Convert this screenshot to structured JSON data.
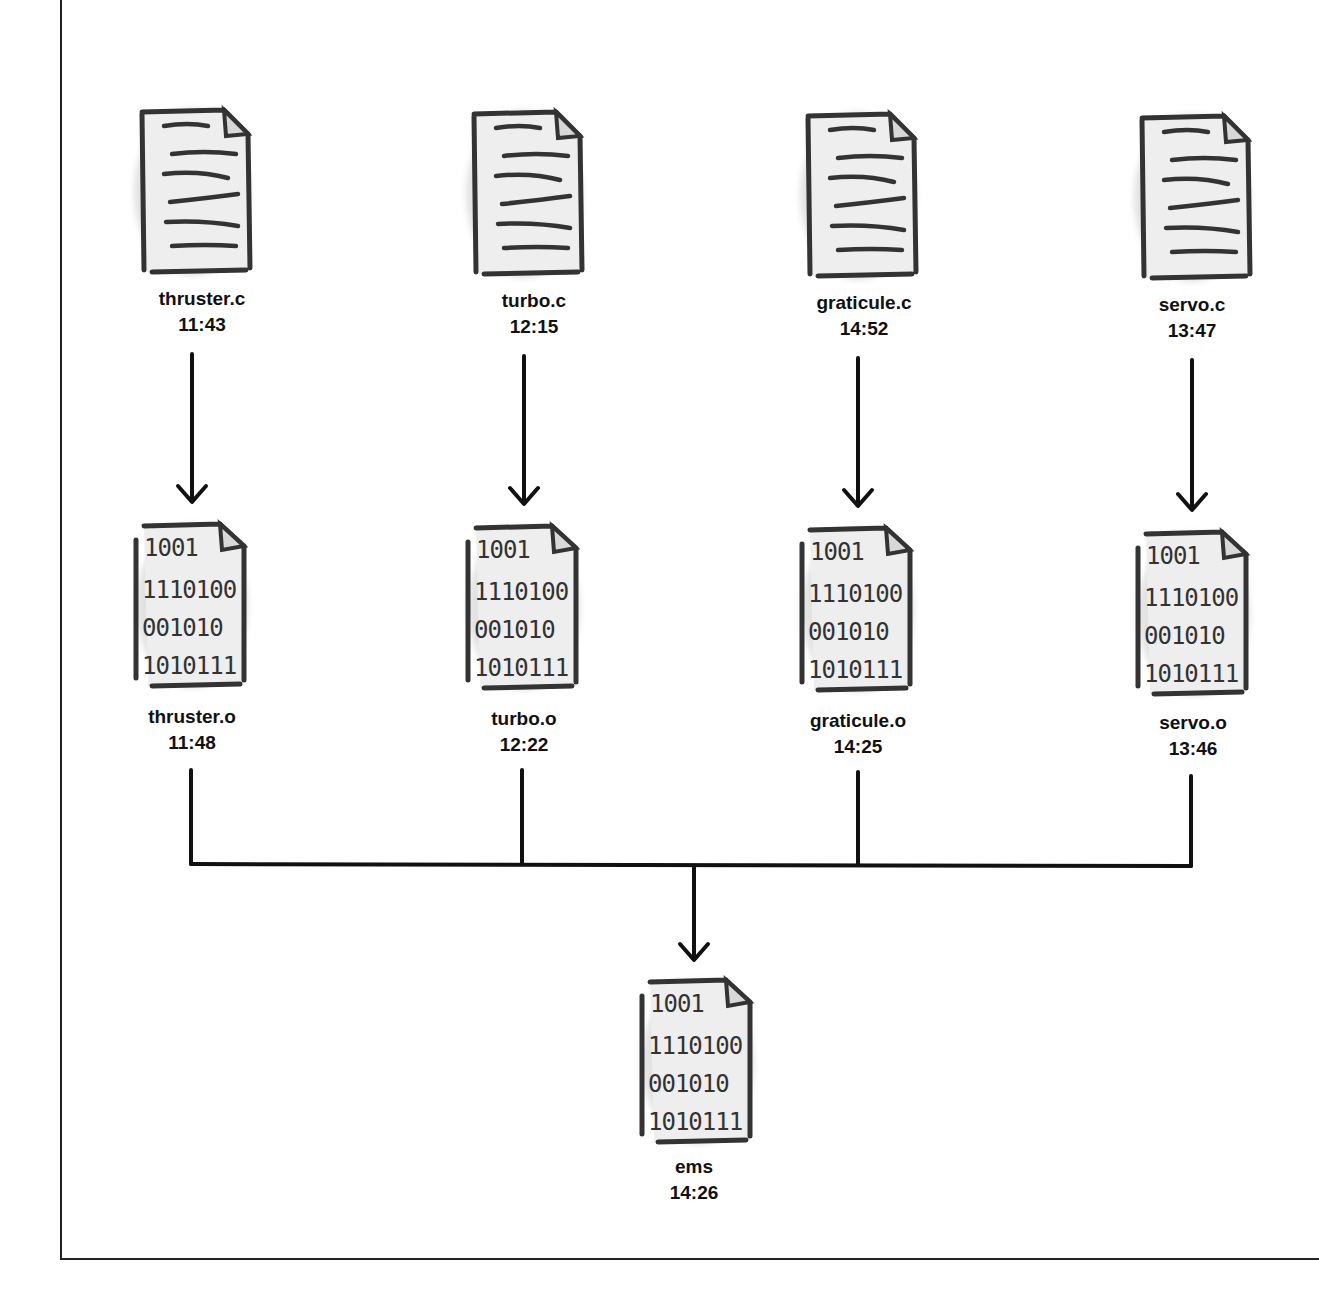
{
  "diagram": {
    "title": "",
    "sources": [
      {
        "name": "thruster.c",
        "time": "11:43",
        "x": 192
      },
      {
        "name": "turbo.c",
        "time": "12:15",
        "x": 524
      },
      {
        "name": "graticule.c",
        "time": "14:52",
        "x": 858
      },
      {
        "name": "servo.c",
        "time": "13:47",
        "x": 1193
      }
    ],
    "objects": [
      {
        "name": "thruster.o",
        "time": "11:48",
        "x": 192
      },
      {
        "name": "turbo.o",
        "time": "12:22",
        "x": 524
      },
      {
        "name": "graticule.o",
        "time": "14:25",
        "x": 858
      },
      {
        "name": "servo.o",
        "time": "13:46",
        "x": 1193
      }
    ],
    "target": {
      "name": "ems",
      "time": "14:26",
      "x": 694
    },
    "binary_lines": [
      "1001",
      "1110100",
      "001010",
      "1010111"
    ],
    "edges": [
      {
        "from": "thruster.c",
        "to": "thruster.o"
      },
      {
        "from": "turbo.c",
        "to": "turbo.o"
      },
      {
        "from": "graticule.c",
        "to": "graticule.o"
      },
      {
        "from": "servo.c",
        "to": "servo.o"
      },
      {
        "from": "thruster.o",
        "to": "ems"
      },
      {
        "from": "turbo.o",
        "to": "ems"
      },
      {
        "from": "graticule.o",
        "to": "ems"
      },
      {
        "from": "servo.o",
        "to": "ems"
      }
    ]
  }
}
